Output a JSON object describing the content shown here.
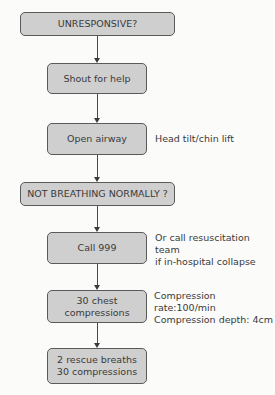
{
  "diagram": {
    "type": "flowchart",
    "steps": [
      {
        "id": "unresponsive",
        "label": "UNRESPONSIVE?",
        "kind": "decision"
      },
      {
        "id": "shout",
        "label": "Shout for help",
        "kind": "action"
      },
      {
        "id": "airway",
        "label": "Open airway",
        "kind": "action",
        "note": "Head tilt/chin lift"
      },
      {
        "id": "breathing",
        "label": "NOT BREATHING NORMALLY ?",
        "kind": "decision"
      },
      {
        "id": "call",
        "label": "Call 999",
        "kind": "action",
        "note": "Or call resuscitation team\nif in-hospital collapse"
      },
      {
        "id": "compressions",
        "label": "30 chest\ncompressions",
        "kind": "action",
        "note": "Compression rate:100/min\nCompression depth: 4cm"
      },
      {
        "id": "cycle",
        "label": "2 rescue breaths\n30 compressions",
        "kind": "action"
      }
    ],
    "edges": [
      [
        "unresponsive",
        "shout"
      ],
      [
        "shout",
        "airway"
      ],
      [
        "airway",
        "breathing"
      ],
      [
        "breathing",
        "call"
      ],
      [
        "call",
        "compressions"
      ],
      [
        "compressions",
        "cycle"
      ]
    ]
  },
  "colors": {
    "box_fill": "#cfcfcf",
    "box_border": "#5a5a5a",
    "text": "#3a3a3a",
    "background": "#fbfbfa"
  }
}
